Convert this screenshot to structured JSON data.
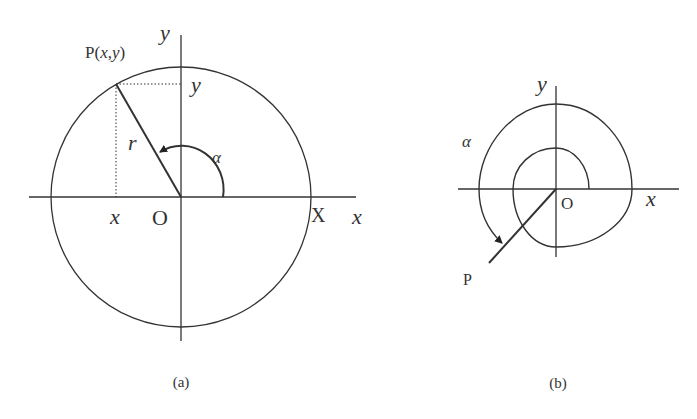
{
  "figure_a": {
    "caption": "(a)",
    "point_label": "P(x,y)",
    "point_label_parts": {
      "prefix": "P(",
      "x": "x",
      "comma": ",",
      "y": "y",
      "suffix": ")"
    },
    "y_axis_label": "y",
    "x_axis_label": "x",
    "y_projection_label": "y",
    "x_projection_label": "x",
    "radius_label": "r",
    "angle_label": "α",
    "origin_label": "O",
    "circle_intercept_label": "X"
  },
  "figure_b": {
    "caption": "(b)",
    "y_axis_label": "y",
    "x_axis_label": "x",
    "angle_label": "α",
    "origin_label": "O",
    "point_label": "P"
  },
  "colors": {
    "line": "#333333",
    "background": "#ffffff"
  }
}
